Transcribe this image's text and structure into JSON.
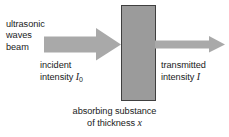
{
  "figure": {
    "background_color": "#ffffff",
    "width": 229,
    "height": 137
  },
  "source_label": {
    "line1": "ultrasonic",
    "line2": "waves",
    "line3": "beam"
  },
  "incident_label": {
    "line1": "incident",
    "line2_prefix": "intensity",
    "symbol": "I",
    "subscript": "0"
  },
  "transmitted_label": {
    "line1": "transmitted",
    "line2_prefix": "intensity",
    "symbol": "I"
  },
  "caption": {
    "line1": "absorbing substance",
    "line2_prefix": "of thickness",
    "symbol": "x"
  },
  "graphics": {
    "incident_arrow": {
      "name": "incident-beam-arrow",
      "fill": "#a9a9a9",
      "description": "thick block arrow pointing right into the slab"
    },
    "absorber_block": {
      "name": "absorbing-substance-block",
      "fill": "#9b9b9b",
      "stroke": "#3f3f3f",
      "description": "vertical gray rectangle representing the absorber of thickness x"
    },
    "transmitted_arrow": {
      "name": "transmitted-beam-arrow",
      "fill": "#a9a9a9",
      "description": "thin block arrow pointing right out of the slab"
    }
  }
}
